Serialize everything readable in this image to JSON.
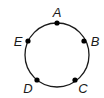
{
  "diagram": {
    "type": "circle-with-points",
    "circle": {
      "cx": 57,
      "cy": 55,
      "r": 32,
      "stroke": "#1a1a1a"
    },
    "points": [
      {
        "label": "A",
        "x": 57,
        "y": 23,
        "lx": 57,
        "ly": 17
      },
      {
        "label": "B",
        "x": 84,
        "y": 41,
        "lx": 95,
        "ly": 46
      },
      {
        "label": "C",
        "x": 75,
        "y": 80,
        "lx": 83,
        "ly": 93
      },
      {
        "label": "D",
        "x": 37,
        "y": 80,
        "lx": 28,
        "ly": 93
      },
      {
        "label": "E",
        "x": 28,
        "y": 41,
        "lx": 18,
        "ly": 46
      }
    ]
  }
}
